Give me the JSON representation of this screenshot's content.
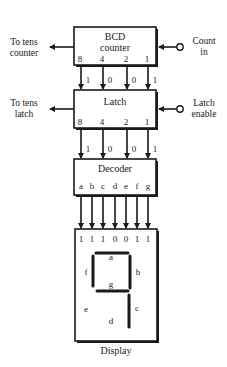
{
  "bcd_counter": {
    "title_line1": "BCD",
    "title_line2": "counter",
    "outputs": [
      "8",
      "4",
      "2",
      "1"
    ],
    "left_label_line1": "To tens",
    "left_label_line2": "counter",
    "right_label_line1": "Count",
    "right_label_line2": "in"
  },
  "bcd_to_latch_bits": [
    "1",
    "0",
    "0",
    "1"
  ],
  "latch": {
    "title": "Latch",
    "outputs": [
      "8",
      "4",
      "2",
      "1"
    ],
    "left_label_line1": "To tens",
    "left_label_line2": "latch",
    "right_label_line1": "Latch",
    "right_label_line2": "enable"
  },
  "latch_to_decoder_bits": [
    "1",
    "0",
    "0",
    "1"
  ],
  "decoder": {
    "title": "Decoder",
    "outputs": [
      "a",
      "b",
      "c",
      "d",
      "e",
      "f",
      "g"
    ]
  },
  "display": {
    "input_bits": [
      "1",
      "1",
      "1",
      "0",
      "0",
      "1",
      "1"
    ],
    "segment_labels": {
      "a": "a",
      "b": "b",
      "c": "c",
      "d": "d",
      "e": "e",
      "f": "f",
      "g": "g"
    },
    "lit_segments": [
      "a",
      "b",
      "c",
      "f",
      "g"
    ],
    "digit_shown": "9",
    "caption": "Display"
  }
}
